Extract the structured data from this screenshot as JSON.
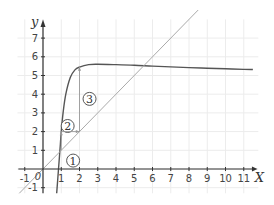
{
  "chart_data": {
    "type": "line",
    "title": "",
    "xlabel": "X",
    "ylabel": "y",
    "xlim": [
      -1.4,
      11.8
    ],
    "ylim": [
      -1.3,
      8.0
    ],
    "grid": true,
    "x_ticks": [
      "-1",
      "0",
      "1",
      "2",
      "3",
      "4",
      "5",
      "6",
      "7",
      "8",
      "9",
      "10",
      "11"
    ],
    "y_ticks": [
      "-1",
      "1",
      "2",
      "3",
      "4",
      "5",
      "6",
      "7"
    ],
    "origin_label": "0",
    "series": [
      {
        "name": "f(x)",
        "style": "curve",
        "color": "#555555",
        "x": [
          0.75,
          0.85,
          0.95,
          1.0,
          1.1,
          1.25,
          1.5,
          1.75,
          2.0,
          2.5,
          3.0,
          4.0,
          5.0,
          6.0,
          7.0,
          8.0,
          9.0,
          10.0,
          11.0,
          11.5
        ],
        "y": [
          -1.3,
          0.0,
          1.3,
          2.0,
          3.0,
          4.0,
          4.9,
          5.3,
          5.45,
          5.58,
          5.6,
          5.58,
          5.55,
          5.5,
          5.46,
          5.42,
          5.39,
          5.36,
          5.33,
          5.32
        ]
      },
      {
        "name": "y = x",
        "style": "line",
        "color": "#aaaaaa",
        "x": [
          -1.3,
          8.5
        ],
        "y": [
          -1.3,
          8.5
        ]
      }
    ],
    "annotations": [
      {
        "label": "1",
        "x": 1.65,
        "y": 0.45,
        "type": "circled"
      },
      {
        "label": "2",
        "x": 1.35,
        "y": 2.3,
        "type": "circled"
      },
      {
        "label": "3",
        "x": 2.55,
        "y": 3.75,
        "type": "circled"
      },
      {
        "type": "arrow",
        "from": [
          1,
          1
        ],
        "to": [
          1,
          2
        ]
      },
      {
        "type": "arrow",
        "from": [
          1,
          2
        ],
        "to": [
          2,
          2
        ]
      },
      {
        "type": "arrow",
        "from": [
          2,
          2
        ],
        "to": [
          2,
          5.45
        ]
      }
    ]
  }
}
